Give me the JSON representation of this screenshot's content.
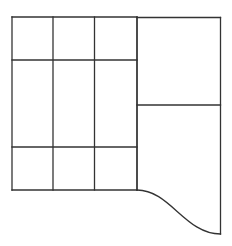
{
  "diagram": {
    "type": "floor-plan-grid",
    "stroke_color": "#333333",
    "stroke_width": 1.3,
    "background": "#ffffff",
    "outer_left_x": 12,
    "outer_top_y": 17,
    "outer_right_x": 220.5,
    "left_block": {
      "columns_x": [
        12,
        53,
        94.5,
        137
      ],
      "rows_y": [
        17,
        60,
        147,
        190
      ],
      "cells": 9
    },
    "right_block": {
      "x_left": 137,
      "x_right": 220.5,
      "divider_y": 105,
      "top_y": 17.5,
      "bottom_y": 234
    },
    "curve": {
      "start": [
        137,
        190
      ],
      "control1": [
        170,
        190
      ],
      "control2": [
        185,
        234
      ],
      "end": [
        220.5,
        234
      ]
    }
  }
}
